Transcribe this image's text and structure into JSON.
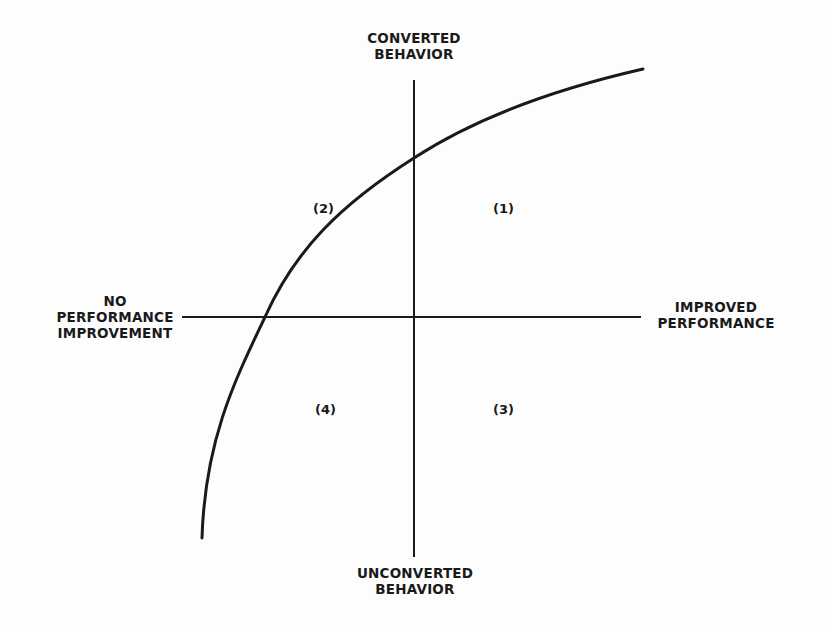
{
  "diagram": {
    "type": "quadrant",
    "axes": {
      "top": [
        "CONVERTED",
        "BEHAVIOR"
      ],
      "bottom": [
        "UNCONVERTED",
        "BEHAVIOR"
      ],
      "left": [
        "NO",
        "PERFORMANCE",
        "IMPROVEMENT"
      ],
      "right": [
        "IMPROVED",
        "PERFORMANCE"
      ]
    },
    "quadrants": {
      "q1": "(1)",
      "q2": "(2)",
      "q3": "(3)",
      "q4": "(4)"
    },
    "colors": {
      "ink": "#1a1a1a",
      "background": "#fdfdfd"
    }
  }
}
